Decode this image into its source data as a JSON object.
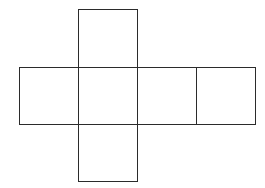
{
  "diagram": {
    "type": "cube-net",
    "stroke_color": "#2b2b2b",
    "fill_color": "#ffffff",
    "faces": [
      {
        "id": "top",
        "x": 78,
        "y": 9,
        "w": 60,
        "h": 58
      },
      {
        "id": "left",
        "x": 19,
        "y": 67,
        "w": 60,
        "h": 58
      },
      {
        "id": "center",
        "x": 78,
        "y": 67,
        "w": 60,
        "h": 58
      },
      {
        "id": "right",
        "x": 137,
        "y": 67,
        "w": 60,
        "h": 58
      },
      {
        "id": "far-right",
        "x": 196,
        "y": 67,
        "w": 60,
        "h": 58
      },
      {
        "id": "bottom",
        "x": 78,
        "y": 124,
        "w": 60,
        "h": 58
      }
    ]
  }
}
